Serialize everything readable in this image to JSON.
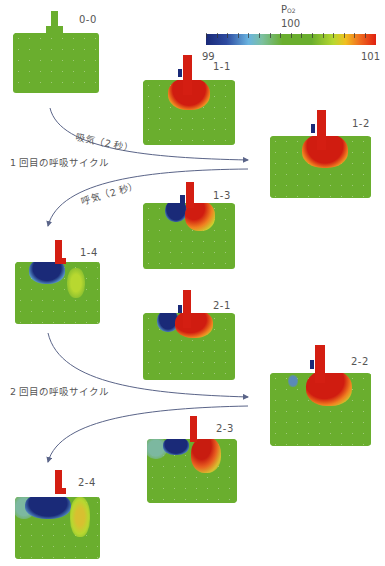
{
  "colorbar": {
    "title": "PO2",
    "title_main": "P",
    "title_sub": "O2",
    "min_label": "99",
    "mid_label": "100",
    "max_label": "101",
    "colors": {
      "low": "#1a2a78",
      "mid": "#6aae2e",
      "high": "#e02010"
    }
  },
  "panels": [
    {
      "id": "0-0",
      "label": "0-0"
    },
    {
      "id": "1-1",
      "label": "1-1"
    },
    {
      "id": "1-2",
      "label": "1-2"
    },
    {
      "id": "1-3",
      "label": "1-3"
    },
    {
      "id": "1-4",
      "label": "1-4"
    },
    {
      "id": "2-1",
      "label": "2-1"
    },
    {
      "id": "2-2",
      "label": "2-2"
    },
    {
      "id": "2-3",
      "label": "2-3"
    },
    {
      "id": "2-4",
      "label": "2-4"
    }
  ],
  "arrows": {
    "inhale_1": "吸気（2 秒）",
    "exhale_1": "呼気（2 秒）"
  },
  "cycles": {
    "first": "1 回目の呼吸サイクル",
    "second": "2 回目の呼吸サイクル"
  }
}
